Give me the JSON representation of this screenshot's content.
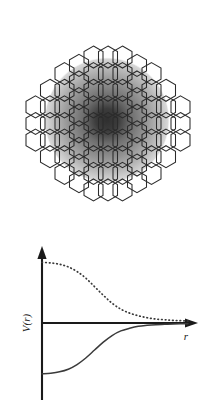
{
  "figure": {
    "caption": "",
    "background_color": "#ffffff"
  },
  "lattice": {
    "name": "hexagonal-lattice",
    "orientation": "pointy-top",
    "cell_width": 19,
    "cell_height": 22,
    "stroke_color": "#2b2b2b",
    "fill_color": "none",
    "columns": 11,
    "bounds": {
      "left": 8,
      "top": 14,
      "right": 208,
      "bottom": 233
    },
    "column_rows": [
      3,
      5,
      7,
      8,
      9,
      9,
      9,
      8,
      7,
      5,
      3
    ]
  },
  "perturbation": {
    "name": "radial-shading",
    "center_x": 107,
    "center_y": 120,
    "radius": 63,
    "core_color": "#2f2f2f",
    "mid_color": "#6e6e6e",
    "edge_color": "#b8b8b8",
    "outer_color": "#ffffff"
  },
  "chart_data": {
    "type": "line",
    "title": "",
    "xlabel": "r",
    "ylabel": "V(r)",
    "grid": false,
    "legend": "none",
    "xlim": [
      0,
      1
    ],
    "ylim": [
      -1,
      1
    ],
    "annotations": [],
    "series": [
      {
        "name": "repulsive-potential",
        "style": "dotted",
        "color": "#3a3a3a",
        "x": [
          0.0,
          0.06,
          0.12,
          0.18,
          0.24,
          0.3,
          0.36,
          0.42,
          0.48,
          0.54,
          0.6,
          0.66,
          0.72,
          0.78,
          0.84,
          0.9,
          1.0
        ],
        "y": [
          0.92,
          0.91,
          0.89,
          0.85,
          0.78,
          0.68,
          0.55,
          0.42,
          0.3,
          0.21,
          0.15,
          0.11,
          0.08,
          0.06,
          0.05,
          0.04,
          0.03
        ]
      },
      {
        "name": "attractive-potential",
        "style": "solid",
        "color": "#3a3a3a",
        "x": [
          0.0,
          0.06,
          0.12,
          0.18,
          0.24,
          0.3,
          0.36,
          0.42,
          0.48,
          0.54,
          0.6,
          0.66,
          0.72,
          0.78,
          0.84,
          0.9,
          1.0
        ],
        "y": [
          -0.77,
          -0.76,
          -0.74,
          -0.7,
          -0.63,
          -0.53,
          -0.41,
          -0.29,
          -0.19,
          -0.12,
          -0.08,
          -0.05,
          -0.035,
          -0.025,
          -0.02,
          -0.015,
          -0.01
        ]
      }
    ],
    "axes": {
      "y_axis_x": 42,
      "x_axis_y": 323,
      "y_axis_top": 248,
      "y_axis_bottom": 400,
      "x_axis_right": 196
    }
  }
}
